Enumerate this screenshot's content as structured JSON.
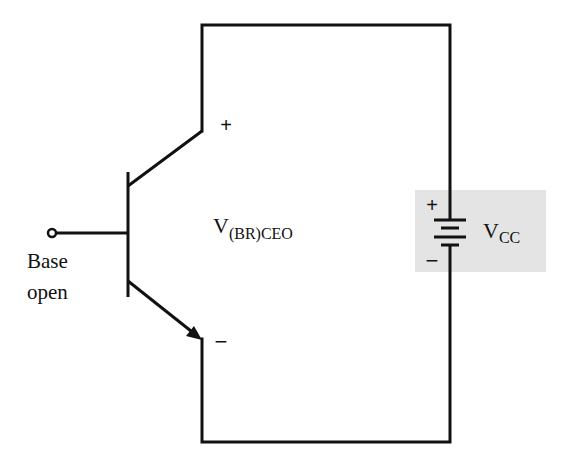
{
  "diagram": {
    "colors": {
      "wire": "#111111",
      "highlight_box": "#e4e4e4",
      "background": "#ffffff"
    },
    "transistor": {
      "type": "NPN BJT",
      "collector_polarity": "+",
      "emitter_polarity": "−"
    },
    "base_label": {
      "line1": "Base",
      "line2": "open"
    },
    "breakdown_voltage": {
      "main": "V",
      "subscript": "(BR)CEO"
    },
    "supply": {
      "plus": "+",
      "minus": "−",
      "main": "V",
      "subscript": "CC"
    }
  }
}
